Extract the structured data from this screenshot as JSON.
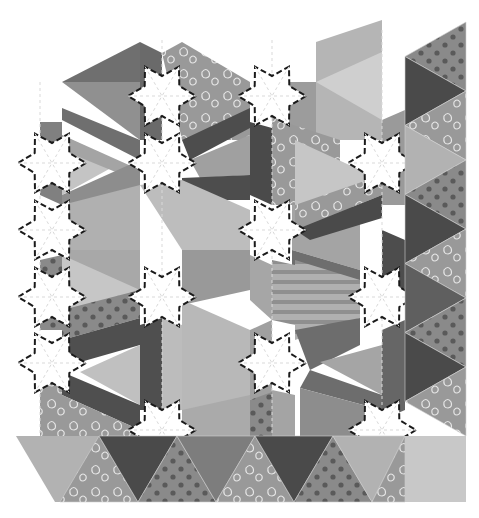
{
  "illustration": {
    "title": "",
    "subject": "hexagon-star patchwork quilt with triangle border",
    "palette": {
      "background": "#ffffff",
      "star": "#ffffff",
      "dark": "#4a4a4a",
      "darkMid": "#5f5f5f",
      "mid": "#7d7d7d",
      "midLight": "#969696",
      "light": "#b2b2b2",
      "lighter": "#c8c8c8",
      "dashLine": "#1a1a1a",
      "seamLine": "#d6d6d6",
      "printMotif": "#e6e6e6",
      "dotMotif": "#5a5a5a"
    },
    "fabric_patterns": [
      "solid",
      "paisley-print",
      "polka-dot",
      "stripe"
    ],
    "stars": [
      {
        "cx": 162,
        "cy": 96
      },
      {
        "cx": 52,
        "cy": 163
      },
      {
        "cx": 272,
        "cy": 96
      },
      {
        "cx": 162,
        "cy": 163
      },
      {
        "cx": 382,
        "cy": 163
      },
      {
        "cx": 52,
        "cy": 230
      },
      {
        "cx": 272,
        "cy": 230
      },
      {
        "cx": 162,
        "cy": 297
      },
      {
        "cx": 52,
        "cy": 297
      },
      {
        "cx": 382,
        "cy": 297
      },
      {
        "cx": 272,
        "cy": 363
      },
      {
        "cx": 162,
        "cy": 430
      },
      {
        "cx": 52,
        "cy": 363
      },
      {
        "cx": 382,
        "cy": 430
      }
    ],
    "bottom_border": {
      "y_top": 436,
      "y_bottom": 502,
      "x_left": 16,
      "x_right": 466,
      "triangles": [
        {
          "dir": "up",
          "fill": "midLight",
          "pattern": "paisley-print"
        },
        {
          "dir": "down",
          "fill": "dark",
          "pattern": "solid"
        },
        {
          "dir": "up",
          "fill": "midLight",
          "pattern": "polka-dot"
        },
        {
          "dir": "down",
          "fill": "mid",
          "pattern": "solid"
        },
        {
          "dir": "up",
          "fill": "midLight",
          "pattern": "paisley-print"
        },
        {
          "dir": "down",
          "fill": "dark",
          "pattern": "solid"
        },
        {
          "dir": "up",
          "fill": "midLight",
          "pattern": "polka-dot"
        },
        {
          "dir": "down",
          "fill": "light",
          "pattern": "solid"
        },
        {
          "dir": "up",
          "fill": "midLight",
          "pattern": "paisley-print"
        }
      ],
      "corner_square": {
        "fill": "lighter"
      }
    },
    "right_border": {
      "x_left": 405,
      "x_right": 466,
      "y_top": 22,
      "y_bottom": 436,
      "triangles": [
        {
          "fill": "mid",
          "pattern": "polka-dot"
        },
        {
          "fill": "dark",
          "pattern": "solid"
        },
        {
          "fill": "midLight",
          "pattern": "paisley-print"
        },
        {
          "fill": "light",
          "pattern": "solid"
        },
        {
          "fill": "mid",
          "pattern": "polka-dot"
        },
        {
          "fill": "dark",
          "pattern": "solid"
        },
        {
          "fill": "midLight",
          "pattern": "paisley-print"
        },
        {
          "fill": "darkMid",
          "pattern": "solid"
        },
        {
          "fill": "mid",
          "pattern": "polka-dot"
        },
        {
          "fill": "dark",
          "pattern": "solid"
        },
        {
          "fill": "midLight",
          "pattern": "paisley-print"
        }
      ]
    }
  }
}
